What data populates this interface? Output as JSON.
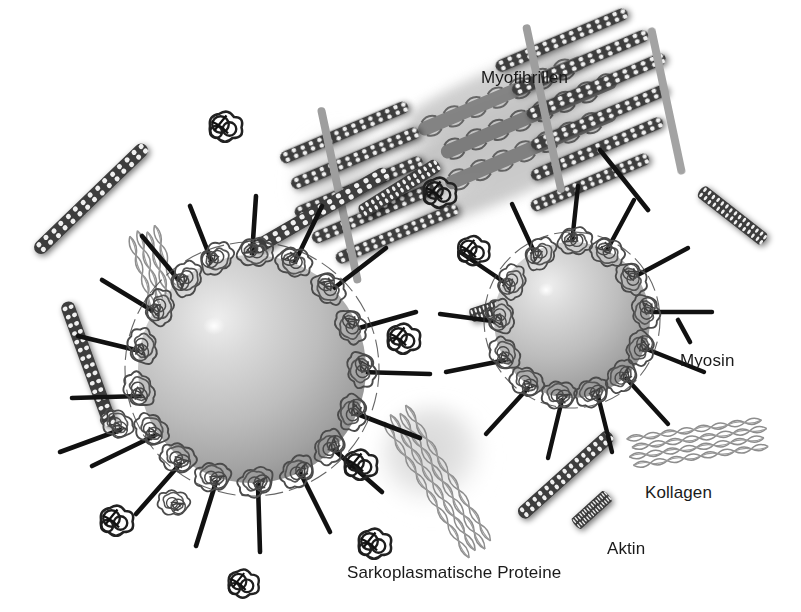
{
  "figure": {
    "title_visible": false,
    "background_color": "#ffffff",
    "width": 801,
    "height": 612
  },
  "labels": {
    "myofibrillen": "Myofibrillen",
    "myosin": "Myosin",
    "kollagen": "Kollagen",
    "aktin": "Aktin",
    "sarkoplasmatische_proteine": "Sarkoplasmatische Proteine"
  },
  "colors": {
    "background": "#ffffff",
    "text": "#1a1a1a",
    "myosin_rod": "#111111",
    "actin_bead": "#3a3a3a",
    "actin_highlight": "#f2f2f2",
    "collagen_strand": "#8b8b8b",
    "z_line": "#9a9a9a",
    "globule_light": "#e3e3e3",
    "globule_mid": "#b9b9b9",
    "globule_dark": "#8e8e8e",
    "ghost_globule": "#d8d8d8",
    "protein_tangle": "#4a4a4a",
    "myofibril_haze": "#a5a5a5"
  },
  "elements": {
    "fat_globules": [
      {
        "name": "large-fat-globule",
        "cx": 252,
        "cy": 369,
        "r": 114
      },
      {
        "name": "small-fat-globule",
        "cx": 572,
        "cy": 320,
        "r": 78
      }
    ],
    "ghost_globules": [
      {
        "name": "background-globule-upper",
        "cx": 348,
        "cy": 185,
        "r": 52
      },
      {
        "name": "background-globule-lower",
        "cx": 434,
        "cy": 460,
        "r": 52
      }
    ],
    "myofibril_bundle": {
      "name": "myofibril-bundle",
      "angle_deg": -23,
      "cx": 480,
      "cy": 145,
      "length": 440,
      "thickness": 170,
      "z_lines": 3
    },
    "free_actin_filaments": 7,
    "free_collagen_bundles": 3,
    "sarcoplasmic_protein_glyphs": 8,
    "myosin_rods_large_globule": 18,
    "myosin_rods_small_globule": 13
  }
}
